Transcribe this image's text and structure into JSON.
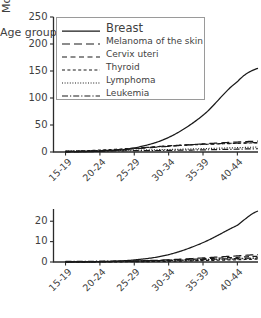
{
  "chart_data": [
    {
      "panel": "top",
      "type": "line",
      "title": "",
      "xlabel": "",
      "ylabel": "Incidence",
      "categories": [
        "15-19",
        "20-24",
        "25-29",
        "30-34",
        "35-39",
        "40-44"
      ],
      "x": [
        0,
        1,
        2,
        3,
        4,
        5
      ],
      "xlim": [
        -0.35,
        5.6
      ],
      "ylim": [
        0,
        250
      ],
      "yticks": [
        0,
        50,
        100,
        150,
        200,
        250
      ],
      "ytick_labels": [
        "0",
        "50",
        "100",
        "150",
        "200",
        "250"
      ],
      "grid": false,
      "legend_position": "upper left",
      "series": [
        {
          "name": "Breast",
          "style": "solid",
          "values": [
            0.3,
            1.4,
            7.5,
            27.0,
            68.0,
            130.0
          ],
          "end_value": 155.0
        },
        {
          "name": "Melanoma of the skin",
          "style": "longdash",
          "values": [
            0.8,
            2.6,
            6.0,
            10.5,
            15.0,
            18.5
          ],
          "end_value": 20.0
        },
        {
          "name": "Cervix uteri",
          "style": "dash",
          "values": [
            0.2,
            1.8,
            6.5,
            11.5,
            14.5,
            16.5
          ],
          "end_value": 17.5
        },
        {
          "name": "Thyroid",
          "style": "shortdash",
          "values": [
            1.0,
            3.5,
            7.0,
            11.0,
            14.0,
            16.0
          ],
          "end_value": 17.0
        },
        {
          "name": "Lymphoma",
          "style": "dotted",
          "values": [
            1.8,
            2.6,
            3.4,
            4.6,
            6.2,
            8.0
          ],
          "end_value": 9.0
        },
        {
          "name": "Leukemia",
          "style": "dashdot",
          "values": [
            1.6,
            2.0,
            2.4,
            3.0,
            4.0,
            5.2
          ],
          "end_value": 6.0
        }
      ]
    },
    {
      "panel": "bottom",
      "type": "line",
      "title": "",
      "xlabel": "Age group",
      "ylabel": "Mortality",
      "categories": [
        "15-19",
        "20-24",
        "25-29",
        "30-34",
        "35-39",
        "40-44"
      ],
      "x": [
        0,
        1,
        2,
        3,
        4,
        5
      ],
      "xlim": [
        -0.35,
        5.6
      ],
      "ylim": [
        0,
        26
      ],
      "yticks": [
        0,
        10,
        20
      ],
      "ytick_labels": [
        "0",
        "10",
        "20"
      ],
      "grid": false,
      "series": [
        {
          "name": "Breast",
          "style": "solid",
          "values": [
            0.05,
            0.2,
            1.0,
            3.6,
            9.5,
            18.0
          ],
          "end_value": 25.0
        },
        {
          "name": "Melanoma of the skin",
          "style": "longdash",
          "values": [
            0.05,
            0.15,
            0.5,
            1.1,
            2.0,
            3.0
          ],
          "end_value": 3.6
        },
        {
          "name": "Cervix uteri",
          "style": "dash",
          "values": [
            0.03,
            0.12,
            0.4,
            0.9,
            1.6,
            2.3
          ],
          "end_value": 2.8
        },
        {
          "name": "Thyroid",
          "style": "shortdash",
          "values": [
            0.02,
            0.06,
            0.15,
            0.35,
            0.7,
            1.1
          ],
          "end_value": 1.4
        },
        {
          "name": "Lymphoma",
          "style": "dotted",
          "values": [
            0.1,
            0.2,
            0.35,
            0.6,
            1.0,
            1.5
          ],
          "end_value": 1.8
        },
        {
          "name": "Leukemia",
          "style": "dashdot",
          "values": [
            0.3,
            0.4,
            0.55,
            0.8,
            1.2,
            1.7
          ],
          "end_value": 2.0
        }
      ]
    }
  ],
  "legend": {
    "items": [
      {
        "label": "Breast",
        "style": "solid"
      },
      {
        "label": "Melanoma of the skin",
        "style": "longdash"
      },
      {
        "label": "Cervix uteri",
        "style": "dash"
      },
      {
        "label": "Thyroid",
        "style": "shortdash"
      },
      {
        "label": "Lymphoma",
        "style": "dotted"
      },
      {
        "label": "Leukemia",
        "style": "dashdot"
      }
    ]
  },
  "colors": {
    "line": "#1a1a1a",
    "axis": "#2b2b2b",
    "text": "#3f3f3f",
    "legend_border": "#9a9a9a",
    "background": "#ffffff"
  }
}
